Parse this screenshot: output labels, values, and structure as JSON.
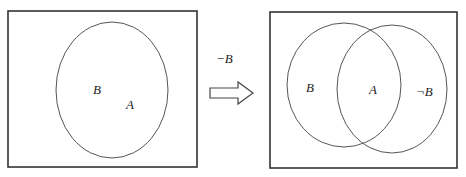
{
  "diagram": {
    "type": "venn-transformation",
    "left_panel": {
      "labels": {
        "outer": "B",
        "inner": "A"
      }
    },
    "transition": {
      "operation_label": "−B",
      "arrow": "right-arrow"
    },
    "right_panel": {
      "labels": {
        "left_circle": "B",
        "intersection": "A",
        "right_circle": "¬B"
      }
    }
  }
}
